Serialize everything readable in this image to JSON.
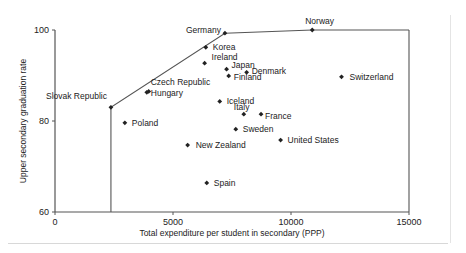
{
  "chart_data": {
    "type": "scatter",
    "title": "",
    "xlabel": "Total expenditure per student in secondary (PPP)",
    "ylabel": "Upper secondary graduation rate",
    "xlim": [
      0,
      15000
    ],
    "ylim": [
      60,
      100
    ],
    "x_ticks": [
      0,
      5000,
      10000,
      15000
    ],
    "y_ticks": [
      60,
      80,
      100
    ],
    "grid": false,
    "legend": null,
    "points": [
      {
        "label": "Slovak Republic",
        "x": 2370,
        "y": 83.0
      },
      {
        "label": "Czech Republic",
        "x": 3970,
        "y": 86.5
      },
      {
        "label": "Hungary",
        "x": 3890,
        "y": 86.3
      },
      {
        "label": "Poland",
        "x": 2960,
        "y": 79.6
      },
      {
        "label": "Germany",
        "x": 7200,
        "y": 99.3
      },
      {
        "label": "Norway",
        "x": 10900,
        "y": 100.0
      },
      {
        "label": "Korea",
        "x": 6390,
        "y": 96.2
      },
      {
        "label": "Ireland",
        "x": 6340,
        "y": 92.7
      },
      {
        "label": "Japan",
        "x": 7270,
        "y": 91.4
      },
      {
        "label": "Denmark",
        "x": 8120,
        "y": 90.7
      },
      {
        "label": "Finland",
        "x": 7360,
        "y": 89.9
      },
      {
        "label": "Switzerland",
        "x": 12140,
        "y": 89.7
      },
      {
        "label": "Iceland",
        "x": 6980,
        "y": 84.3
      },
      {
        "label": "Italy",
        "x": 8000,
        "y": 81.5
      },
      {
        "label": "France",
        "x": 8730,
        "y": 81.5
      },
      {
        "label": "Sweden",
        "x": 7660,
        "y": 78.2
      },
      {
        "label": "United States",
        "x": 9560,
        "y": 75.8
      },
      {
        "label": "New Zealand",
        "x": 5620,
        "y": 74.7
      },
      {
        "label": "Spain",
        "x": 6430,
        "y": 66.4
      }
    ],
    "frontier": {
      "description": "Efficiency frontier line",
      "path": [
        [
          2370,
          60
        ],
        [
          2370,
          83.0
        ],
        [
          7200,
          99.3
        ],
        [
          10900,
          100.0
        ],
        [
          15000,
          100.0
        ]
      ]
    }
  },
  "labels": {
    "x_axis_title": "Total expenditure per student in secondary (PPP)",
    "y_axis_title": "Upper secondary graduation rate"
  }
}
